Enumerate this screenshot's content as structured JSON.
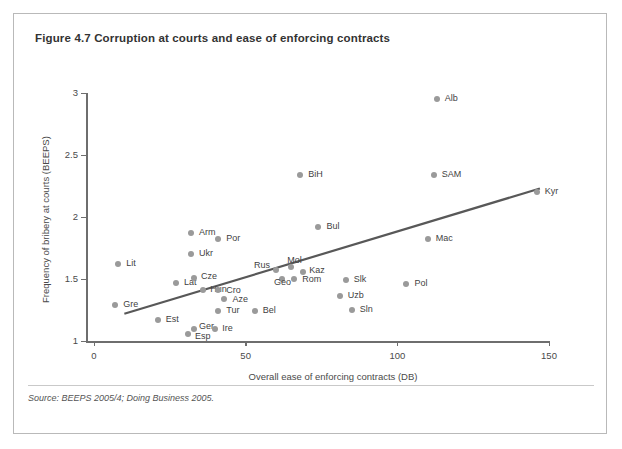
{
  "figure": {
    "title": "Figure 4.7  Corruption at courts and ease of enforcing contracts",
    "source": "Source: BEEPS 2005/4; Doing Business 2005."
  },
  "chart_data": {
    "type": "scatter",
    "title": "Figure 4.7  Corruption at courts and ease of enforcing contracts",
    "xlabel": "Overall ease of enforcing contracts (DB)",
    "ylabel": "Frequency of bribery at courts (BEEPS)",
    "xlim": [
      0,
      150
    ],
    "ylim": [
      1,
      3
    ],
    "xticks": [
      "0",
      "50",
      "100",
      "150"
    ],
    "yticks": [
      "1",
      "1.5",
      "2",
      "2.5",
      "3"
    ],
    "grid": false,
    "legend": "none",
    "trendline": {
      "label": "linear fit",
      "x": [
        10,
        147
      ],
      "y": [
        1.22,
        2.23
      ],
      "color": "#585858"
    },
    "point_color": "#9a9a9a",
    "points": [
      {
        "label": "Lit",
        "x": 8,
        "y": 1.62,
        "lx": 8,
        "ly": 0
      },
      {
        "label": "Gre",
        "x": 7,
        "y": 1.29,
        "lx": 8,
        "ly": 0
      },
      {
        "label": "Est",
        "x": 21,
        "y": 1.17,
        "lx": 8,
        "ly": 0
      },
      {
        "label": "Lat",
        "x": 27,
        "y": 1.47,
        "lx": 8,
        "ly": 0
      },
      {
        "label": "Cze",
        "x": 33,
        "y": 1.51,
        "lx": 7,
        "ly": -1
      },
      {
        "label": "Esp",
        "x": 31,
        "y": 1.06,
        "lx": 7,
        "ly": 3
      },
      {
        "label": "Ger",
        "x": 33,
        "y": 1.1,
        "lx": 5,
        "ly": -2
      },
      {
        "label": "Ire",
        "x": 40,
        "y": 1.1,
        "lx": 7,
        "ly": 0
      },
      {
        "label": "Hun",
        "x": 36,
        "y": 1.41,
        "lx": 7,
        "ly": 0
      },
      {
        "label": "Arm",
        "x": 32,
        "y": 1.87,
        "lx": 8,
        "ly": 0
      },
      {
        "label": "Ukr",
        "x": 32,
        "y": 1.7,
        "lx": 8,
        "ly": 0
      },
      {
        "label": "Por",
        "x": 41,
        "y": 1.82,
        "lx": 8,
        "ly": 0
      },
      {
        "label": "Cro",
        "x": 41,
        "y": 1.41,
        "lx": 8,
        "ly": 1
      },
      {
        "label": "Aze",
        "x": 43,
        "y": 1.34,
        "lx": 8,
        "ly": 1
      },
      {
        "label": "Tur",
        "x": 41,
        "y": 1.24,
        "lx": 8,
        "ly": 0
      },
      {
        "label": "Bel",
        "x": 53,
        "y": 1.24,
        "lx": 8,
        "ly": 0
      },
      {
        "label": "Rus",
        "x": 60,
        "y": 1.57,
        "lx": -22,
        "ly": -4
      },
      {
        "label": "Geo",
        "x": 62,
        "y": 1.5,
        "lx": -8,
        "ly": 4
      },
      {
        "label": "Mol",
        "x": 65,
        "y": 1.6,
        "lx": -4,
        "ly": -6
      },
      {
        "label": "Rom",
        "x": 66,
        "y": 1.5,
        "lx": 8,
        "ly": 1
      },
      {
        "label": "Kaz",
        "x": 69,
        "y": 1.56,
        "lx": 6,
        "ly": -1
      },
      {
        "label": "BiH",
        "x": 68,
        "y": 2.34,
        "lx": 8,
        "ly": 0
      },
      {
        "label": "Bul",
        "x": 74,
        "y": 1.92,
        "lx": 8,
        "ly": 0
      },
      {
        "label": "Slk",
        "x": 83,
        "y": 1.49,
        "lx": 8,
        "ly": 0
      },
      {
        "label": "Uzb",
        "x": 81,
        "y": 1.36,
        "lx": 8,
        "ly": 0
      },
      {
        "label": "Sln",
        "x": 85,
        "y": 1.25,
        "lx": 8,
        "ly": 0
      },
      {
        "label": "Pol",
        "x": 103,
        "y": 1.46,
        "lx": 8,
        "ly": 0
      },
      {
        "label": "Alb",
        "x": 113,
        "y": 2.95,
        "lx": 8,
        "ly": 0
      },
      {
        "label": "SAM",
        "x": 112,
        "y": 2.34,
        "lx": 8,
        "ly": 0
      },
      {
        "label": "Mac",
        "x": 110,
        "y": 1.82,
        "lx": 8,
        "ly": 0
      },
      {
        "label": "Kyr",
        "x": 146,
        "y": 2.2,
        "lx": 8,
        "ly": 0
      }
    ]
  }
}
